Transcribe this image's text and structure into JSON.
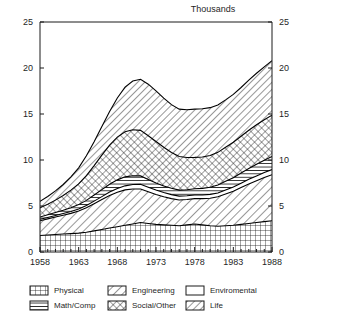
{
  "chart_data": {
    "type": "area",
    "title": "",
    "unit_label": "Thousands",
    "xlabel": "",
    "ylabel": "",
    "xlim": [
      1958,
      1988
    ],
    "ylim": [
      0,
      25
    ],
    "xticks": [
      1958,
      1963,
      1968,
      1973,
      1978,
      1983,
      1988
    ],
    "yticks": [
      0,
      5,
      10,
      15,
      20,
      25
    ],
    "grid": false,
    "legend_position": "bottom",
    "stacked": true,
    "axes": {
      "left_ticks": [
        "0",
        "5",
        "10",
        "15",
        "20",
        "25"
      ],
      "right_ticks": [
        "0",
        "5",
        "10",
        "15",
        "20",
        "25"
      ],
      "x_tick_labels": [
        "1958",
        "1963",
        "1968",
        "1973",
        "1978",
        "1983",
        "1988"
      ],
      "minor_tick_interval": 1
    },
    "x": [
      1958,
      1959,
      1960,
      1961,
      1962,
      1963,
      1964,
      1965,
      1966,
      1967,
      1968,
      1969,
      1970,
      1971,
      1972,
      1973,
      1974,
      1975,
      1976,
      1977,
      1978,
      1979,
      1980,
      1981,
      1982,
      1983,
      1984,
      1985,
      1986,
      1987,
      1988
    ],
    "series": [
      {
        "name": "Physical",
        "pattern": "grid-crosshatch",
        "values": [
          1.8,
          1.85,
          1.9,
          1.95,
          2.0,
          2.05,
          2.15,
          2.3,
          2.45,
          2.6,
          2.75,
          2.9,
          3.05,
          3.2,
          3.1,
          3.0,
          2.95,
          2.9,
          2.85,
          2.95,
          3.05,
          2.95,
          2.85,
          2.8,
          2.85,
          2.9,
          3.0,
          3.1,
          3.2,
          3.3,
          3.4
        ]
      },
      {
        "name": "Engineering",
        "pattern": "diagonal-lines",
        "values": [
          1.6,
          1.75,
          1.9,
          2.05,
          2.2,
          2.4,
          2.65,
          2.95,
          3.25,
          3.55,
          3.75,
          3.85,
          3.8,
          3.65,
          3.45,
          3.25,
          3.05,
          2.9,
          2.8,
          2.75,
          2.75,
          2.85,
          3.0,
          3.2,
          3.45,
          3.7,
          4.0,
          4.3,
          4.55,
          4.8,
          5.0
        ]
      },
      {
        "name": "Enviromental",
        "pattern": "blank",
        "values": [
          0.15,
          0.16,
          0.17,
          0.18,
          0.2,
          0.22,
          0.25,
          0.28,
          0.32,
          0.36,
          0.4,
          0.44,
          0.48,
          0.52,
          0.5,
          0.48,
          0.46,
          0.44,
          0.42,
          0.41,
          0.4,
          0.4,
          0.41,
          0.42,
          0.44,
          0.46,
          0.48,
          0.5,
          0.52,
          0.54,
          0.56
        ]
      },
      {
        "name": "Math/Comp",
        "pattern": "horizontal-lines",
        "values": [
          0.25,
          0.28,
          0.32,
          0.36,
          0.42,
          0.48,
          0.56,
          0.66,
          0.76,
          0.86,
          0.94,
          0.98,
          0.96,
          0.9,
          0.84,
          0.78,
          0.72,
          0.68,
          0.66,
          0.66,
          0.68,
          0.72,
          0.78,
          0.86,
          0.94,
          1.02,
          1.1,
          1.18,
          1.26,
          1.34,
          1.42
        ]
      },
      {
        "name": "Social/Other",
        "pattern": "diagonal-crosshatch",
        "values": [
          1.0,
          1.15,
          1.35,
          1.6,
          1.9,
          2.25,
          2.7,
          3.2,
          3.75,
          4.25,
          4.65,
          4.9,
          5.0,
          4.95,
          4.75,
          4.5,
          4.2,
          3.9,
          3.65,
          3.5,
          3.4,
          3.4,
          3.45,
          3.55,
          3.7,
          3.85,
          4.0,
          4.15,
          4.3,
          4.4,
          4.5
        ]
      },
      {
        "name": "Life",
        "pattern": "diagonal-lines-wide",
        "values": [
          0.7,
          0.85,
          1.0,
          1.2,
          1.45,
          1.75,
          2.15,
          2.6,
          3.1,
          3.65,
          4.25,
          4.85,
          5.3,
          5.55,
          5.6,
          5.5,
          5.35,
          5.2,
          5.15,
          5.2,
          5.25,
          5.25,
          5.2,
          5.15,
          5.15,
          5.2,
          5.3,
          5.45,
          5.6,
          5.75,
          5.92
        ]
      }
    ],
    "totals_note": "Stacked totals rise from about 5.5 in 1958 to a local peak near 18.8 in 1972, dip to about 15.6 in 1978, then climb to about 20.8 in 1988."
  },
  "legend": {
    "entries": [
      {
        "label": "Physical",
        "pattern": "grid-crosshatch"
      },
      {
        "label": "Engineering",
        "pattern": "diagonal-lines"
      },
      {
        "label": "Enviromental",
        "pattern": "blank"
      },
      {
        "label": "Math/Comp",
        "pattern": "horizontal-lines"
      },
      {
        "label": "Social/Other",
        "pattern": "diagonal-crosshatch"
      },
      {
        "label": "Life",
        "pattern": "diagonal-lines-wide"
      }
    ]
  }
}
